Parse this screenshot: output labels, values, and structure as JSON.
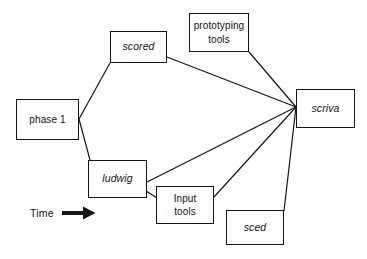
{
  "diagram": {
    "background_color": "#ffffff",
    "line_color": "#141414",
    "text_color": "#111111",
    "nodes": [
      {
        "id": "phase1",
        "label": "phase 1",
        "style": "upright",
        "x": 16,
        "y": 99,
        "w": 63,
        "h": 41
      },
      {
        "id": "scored",
        "label": "scored",
        "style": "italic",
        "x": 110,
        "y": 31,
        "w": 57,
        "h": 32
      },
      {
        "id": "prototyping-tools",
        "label": "prototyping\ntools",
        "style": "upright",
        "x": 189,
        "y": 13,
        "w": 60,
        "h": 39
      },
      {
        "id": "scriva",
        "label": "scriva",
        "style": "italic",
        "x": 296,
        "y": 89,
        "w": 59,
        "h": 39
      },
      {
        "id": "ludwig",
        "label": "ludwig",
        "style": "italic",
        "x": 88,
        "y": 160,
        "w": 59,
        "h": 38
      },
      {
        "id": "input-tools",
        "label": "Input\ntools",
        "style": "upright",
        "x": 156,
        "y": 186,
        "w": 58,
        "h": 38
      },
      {
        "id": "sced",
        "label": "sced",
        "style": "italic",
        "x": 226,
        "y": 210,
        "w": 58,
        "h": 35
      }
    ],
    "edges": [
      {
        "id": "phase1-to-scored",
        "from": "phase1",
        "to": "scored",
        "x1": 79,
        "y1": 119,
        "x2": 110,
        "y2": 63
      },
      {
        "id": "phase1-to-ludwig",
        "from": "phase1",
        "to": "ludwig",
        "x1": 79,
        "y1": 119,
        "x2": 90,
        "y2": 160
      },
      {
        "id": "scored-to-scriva",
        "from": "scored",
        "to": "scriva",
        "x1": 167,
        "y1": 57,
        "x2": 296,
        "y2": 107
      },
      {
        "id": "prototyping-tools-to-scriva",
        "from": "prototyping-tools",
        "to": "scriva",
        "x1": 249,
        "y1": 52,
        "x2": 296,
        "y2": 107
      },
      {
        "id": "ludwig-to-scriva",
        "from": "ludwig",
        "to": "scriva",
        "x1": 147,
        "y1": 182,
        "x2": 296,
        "y2": 107
      },
      {
        "id": "ludwig-to-input-tools",
        "from": "ludwig",
        "to": "input-tools",
        "x1": 143,
        "y1": 189,
        "x2": 157,
        "y2": 198
      },
      {
        "id": "input-tools-to-scriva",
        "from": "input-tools",
        "to": "scriva",
        "x1": 214,
        "y1": 197,
        "x2": 296,
        "y2": 107
      },
      {
        "id": "sced-to-scriva",
        "from": "sced",
        "to": "scriva",
        "x1": 284,
        "y1": 211,
        "x2": 296,
        "y2": 107
      }
    ],
    "time_axis": {
      "label": "Time",
      "icon": "right-arrow-icon"
    }
  }
}
